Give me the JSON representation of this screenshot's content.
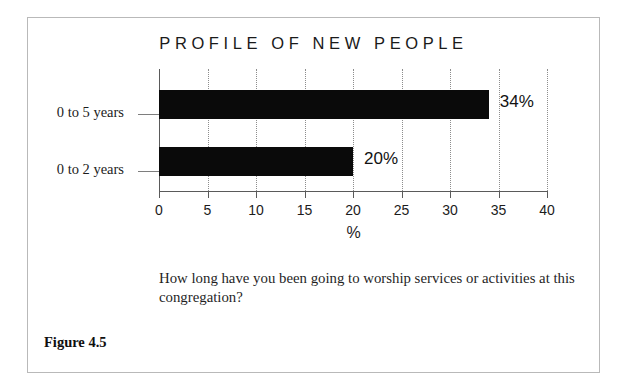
{
  "figure": {
    "label": "Figure 4.5",
    "question": "How long have you been going to worship services or activities at this congregation?"
  },
  "chart_data": {
    "type": "bar",
    "orientation": "horizontal",
    "title": "PROFILE OF NEW PEOPLE",
    "categories": [
      "0 to 5 years",
      "0 to 2 years"
    ],
    "values": [
      34,
      20
    ],
    "value_labels": [
      "34%",
      "20%"
    ],
    "xlabel": "%",
    "ylabel": "",
    "xlim": [
      0,
      40
    ],
    "xticks": [
      0,
      5,
      10,
      15,
      20,
      25,
      30,
      35,
      40
    ],
    "xtick_labels": [
      "0",
      "5",
      "10",
      "15",
      "20",
      "25",
      "30",
      "35",
      "40"
    ],
    "grid": "vertical-dotted",
    "legend": "none",
    "bar_color": "#0a0a0a",
    "background_color": "#ffffff",
    "frame_color": "#b9b9b9"
  }
}
